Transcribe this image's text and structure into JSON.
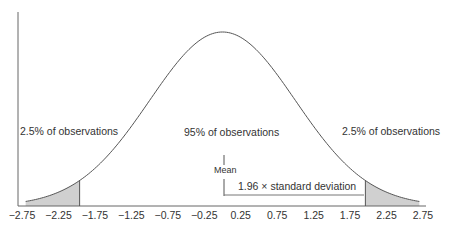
{
  "chart_data": {
    "type": "area",
    "title": "",
    "xlabel": "",
    "ylabel": "",
    "xlim": [
      -2.75,
      2.75
    ],
    "grid": false,
    "tick_labels": [
      "-2.75",
      "-2.25",
      "-1.75",
      "-1.25",
      "-0.75",
      "-0.25",
      "0.25",
      "0.75",
      "1.25",
      "1.75",
      "2.25",
      "2.75"
    ],
    "tick_values": [
      -2.75,
      -2.25,
      -1.75,
      -1.25,
      -0.75,
      -0.25,
      0.25,
      0.75,
      1.25,
      1.75,
      2.25,
      2.75
    ],
    "distribution": {
      "mean": 0,
      "sd": 1
    },
    "shaded_regions": [
      {
        "from": -2.75,
        "to": -1.96,
        "fill": "#d0d0d0"
      },
      {
        "from": 1.96,
        "to": 2.75,
        "fill": "#d0d0d0"
      }
    ],
    "annotations": {
      "left_tail": "2.5% of observations",
      "center": "95% of observations",
      "right_tail": "2.5% of observations",
      "mean": "Mean",
      "sd_bracket": "1.96 × standard deviation"
    },
    "colors": {
      "curve": "#555555",
      "axis": "#666666",
      "shade": "#d0d0d0",
      "text": "#333333"
    }
  }
}
